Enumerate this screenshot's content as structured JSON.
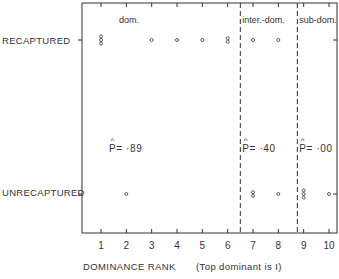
{
  "chart_data": {
    "type": "scatter",
    "title": "",
    "xlabel": "DOMINANCE RANK",
    "xlabel_note": "(Top dominant is I)",
    "ylabel": "",
    "x_ticks": [
      "1",
      "2",
      "3",
      "4",
      "5",
      "6",
      "7",
      "8",
      "9",
      "10"
    ],
    "xlim": [
      0.3,
      10.3
    ],
    "y_categories": [
      "RECAPTURED",
      "UNRECAPTURED"
    ],
    "series": [
      {
        "name": "RECAPTURED",
        "counts_by_rank": [
          3,
          0,
          1,
          1,
          1,
          2,
          1,
          1,
          0,
          0
        ]
      },
      {
        "name": "UNRECAPTURED",
        "counts_by_rank": [
          0,
          1,
          0,
          0,
          0,
          0,
          2,
          1,
          3,
          1
        ]
      }
    ],
    "groups": [
      {
        "label": "dom.",
        "ranks": [
          1,
          6
        ],
        "p_hat": "P̂= ·89",
        "p_label": "= ·89"
      },
      {
        "label": "inter.-dom.",
        "ranks": [
          7,
          8
        ],
        "p_hat": "P̂= ·40",
        "p_label": "= ·40"
      },
      {
        "label": "sub-dom.",
        "ranks": [
          9,
          10
        ],
        "p_hat": "P̂= ·00",
        "p_label": "= ·00"
      }
    ],
    "dividers_at_rank": [
      6.5,
      8.75
    ],
    "grid": false,
    "colors": {
      "ink": "#333333",
      "background": "#ffffff"
    }
  }
}
